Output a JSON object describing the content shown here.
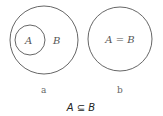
{
  "diagram": {
    "panel_a": {
      "outer_label": "B",
      "inner_label": "A",
      "caption": "a"
    },
    "panel_b": {
      "label": "A = B",
      "caption": "b"
    },
    "relation": "A ⊆ B",
    "colors": {
      "stroke": "#555555",
      "background": "#ffffff"
    }
  }
}
